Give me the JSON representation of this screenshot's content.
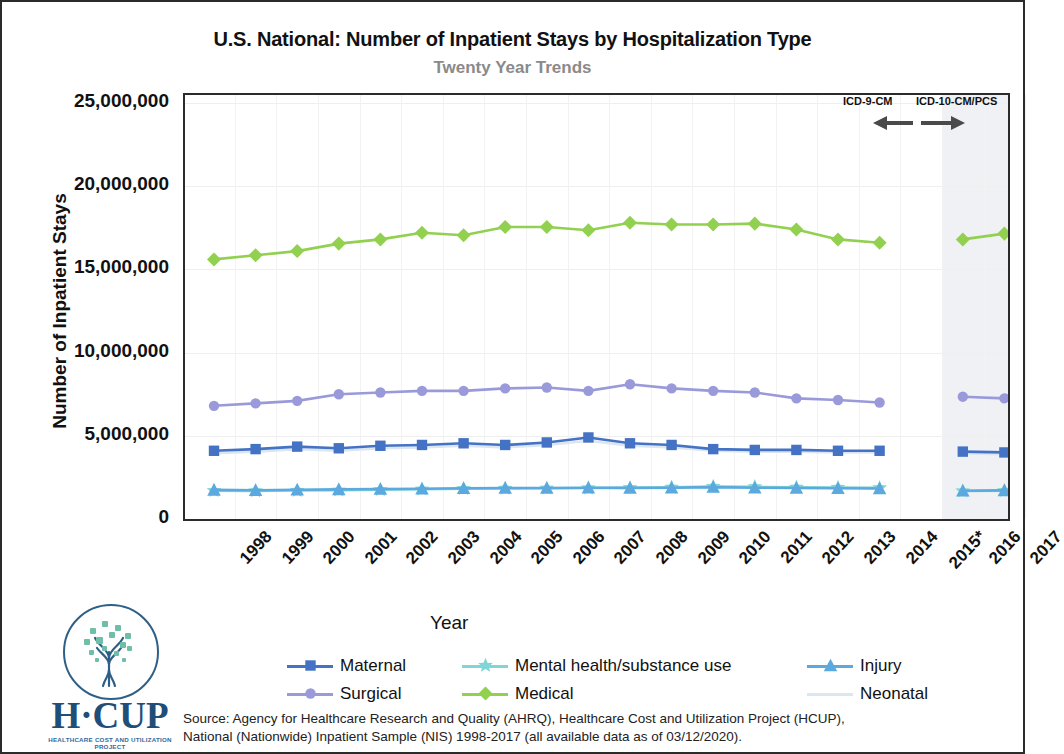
{
  "chart_data": {
    "type": "line",
    "title": "U.S. National: Number of Inpatient Stays by Hospitalization Type",
    "subtitle": "Twenty Year Trends",
    "xlabel": "Year",
    "ylabel": "Number of Inpatient Stays",
    "ylim": [
      0,
      25000000
    ],
    "ytick_labels": [
      "0",
      "5,000,000",
      "10,000,000",
      "15,000,000",
      "20,000,000",
      "25,000,000"
    ],
    "ytick_values": [
      0,
      5000000,
      10000000,
      15000000,
      20000000,
      25000000
    ],
    "grid": true,
    "legend_position": "bottom",
    "categories": [
      "1998",
      "1999",
      "2000",
      "2001",
      "2002",
      "2003",
      "2004",
      "2005",
      "2006",
      "2007",
      "2008",
      "2009",
      "2010",
      "2011",
      "2012",
      "2013",
      "2014",
      "2015*",
      "2016",
      "2017"
    ],
    "note": "No data collected for 2015; coding system changed from ICD-9-CM to ICD-10-CM/PCS in late 2015",
    "series": [
      {
        "name": "Medical",
        "color": "#92D050",
        "marker": "diamond",
        "values": [
          15600000,
          15850000,
          16100000,
          16550000,
          16800000,
          17200000,
          17050000,
          17550000,
          17550000,
          17350000,
          17800000,
          17700000,
          17700000,
          17750000,
          17400000,
          16800000,
          16600000,
          null,
          16800000,
          17150000
        ]
      },
      {
        "name": "Surgical",
        "color": "#9A9ADB",
        "marker": "circle",
        "values": [
          6800000,
          6950000,
          7100000,
          7500000,
          7600000,
          7700000,
          7700000,
          7850000,
          7900000,
          7700000,
          8100000,
          7850000,
          7700000,
          7600000,
          7250000,
          7150000,
          7000000,
          null,
          7350000,
          7250000
        ]
      },
      {
        "name": "Maternal",
        "color": "#4472C4",
        "marker": "square",
        "values": [
          4100000,
          4200000,
          4350000,
          4250000,
          4400000,
          4450000,
          4550000,
          4450000,
          4600000,
          4900000,
          4550000,
          4450000,
          4200000,
          4150000,
          4150000,
          4100000,
          4100000,
          null,
          4050000,
          4000000
        ]
      },
      {
        "name": "Neonatal",
        "color": "#DCE6F1",
        "marker": "none",
        "values": [
          3950000,
          4050000,
          4200000,
          4100000,
          4250000,
          4300000,
          4400000,
          4300000,
          4450000,
          4700000,
          4400000,
          4300000,
          4100000,
          4050000,
          4050000,
          4000000,
          4000000,
          null,
          3950000,
          3900000
        ]
      },
      {
        "name": "Injury",
        "color": "#5BA9DE",
        "marker": "triangle",
        "values": [
          1750000,
          1730000,
          1760000,
          1780000,
          1800000,
          1820000,
          1850000,
          1860000,
          1860000,
          1880000,
          1870000,
          1880000,
          1920000,
          1880000,
          1860000,
          1850000,
          1830000,
          null,
          1700000,
          1720000
        ]
      },
      {
        "name": "Mental health/substance use",
        "color": "#7FD6D6",
        "marker": "star",
        "values": [
          1700000,
          1690000,
          1710000,
          1730000,
          1760000,
          1790000,
          1820000,
          1840000,
          1850000,
          1860000,
          1880000,
          1900000,
          1950000,
          1930000,
          1900000,
          1890000,
          1870000,
          null,
          1680000,
          1700000
        ]
      }
    ]
  },
  "annotations": {
    "icd9_label": "ICD-9-CM",
    "icd10_label": "ICD-10-CM/PCS",
    "icd9_arrow": "left-arrow",
    "icd10_arrow": "right-arrow"
  },
  "legend": {
    "entries": [
      {
        "label": "Maternal",
        "series": "Maternal"
      },
      {
        "label": "Mental health/substance use",
        "series": "Mental health/substance use"
      },
      {
        "label": "Injury",
        "series": "Injury"
      },
      {
        "label": "Surgical",
        "series": "Surgical"
      },
      {
        "label": "Medical",
        "series": "Medical"
      },
      {
        "label": "Neonatal",
        "series": "Neonatal"
      }
    ]
  },
  "source": {
    "line1": "Source: Agency for Healthcare Research and Quality (AHRQ), Healthcare Cost and Utilization Project (HCUP),",
    "line2": "National (Nationwide) Inpatient Sample (NIS) 1998-2017 (all available data as of 03/12/2020)."
  },
  "logo": {
    "wordmark": "H·CUP",
    "tagline": "HEALTHCARE COST AND UTILIZATION PROJECT",
    "icon": "tree-in-circle-icon"
  }
}
